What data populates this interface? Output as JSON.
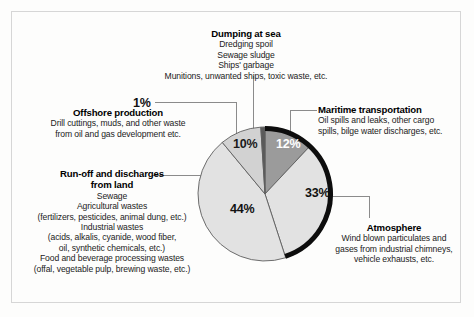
{
  "figure": {
    "background_color": "#fdfdfc",
    "frame_color": "#d6d6d6"
  },
  "chart_data": {
    "type": "pie",
    "title": "",
    "subtitle": "",
    "xlabel": "",
    "ylabel": "",
    "legend_position": "callouts-around-pie",
    "grid": false,
    "total": 100,
    "unit": "%",
    "start_angle_deg": 0,
    "direction": "clockwise",
    "categories": [
      "Maritime transportation",
      "Atmosphere",
      "Run-off and discharges from land",
      "Dumping at sea",
      "Offshore production"
    ],
    "values": [
      12,
      33,
      44,
      10,
      1
    ],
    "labels": [
      "12%",
      "33%",
      "44%",
      "10%",
      "1%"
    ],
    "colors": [
      "#9b9b9b",
      "#e2e2e2",
      "#e2e2e2",
      "#d2d2d2",
      "#5a5a5a"
    ],
    "slices": [
      {
        "name": "Maritime transportation",
        "value": 12,
        "label": "12%",
        "color": "#9b9b9b",
        "label_color": "#ffffff",
        "start_deg": 0,
        "end_deg": 43.2
      },
      {
        "name": "Atmosphere",
        "value": 33,
        "label": "33%",
        "color": "#e2e2e2",
        "label_color": "#111111",
        "start_deg": 43.2,
        "end_deg": 162.0
      },
      {
        "name": "Run-off and discharges from land",
        "value": 44,
        "label": "44%",
        "color": "#e2e2e2",
        "label_color": "#111111",
        "start_deg": 162.0,
        "end_deg": 320.4
      },
      {
        "name": "Dumping at sea",
        "value": 10,
        "label": "10%",
        "color": "#d2d2d2",
        "label_color": "#1a1a1a",
        "start_deg": 320.4,
        "end_deg": 356.4
      },
      {
        "name": "Offshore production",
        "value": 1,
        "label": "1%",
        "color": "#5a5a5a",
        "label_color": "#111111",
        "start_deg": 356.4,
        "end_deg": 360.0
      }
    ],
    "annotations": [
      {
        "slice": "Dumping at sea",
        "heading": "Dumping at sea",
        "lines": [
          "Dredging spoil",
          "Sewage sludge",
          "Ships' garbage",
          "Munitions, unwanted ships, toxic waste, etc."
        ]
      },
      {
        "slice": "Offshore production",
        "heading": "Offshore production",
        "percent": "1%",
        "lines": [
          "Drill cuttings, muds, and other waste",
          "from oil and gas development etc."
        ]
      },
      {
        "slice": "Maritime transportation",
        "heading": "Maritime transportation",
        "lines": [
          "Oil spills and leaks, other cargo",
          "spills, bilge water discharges, etc."
        ]
      },
      {
        "slice": "Run-off and discharges from land",
        "heading_line1": "Run-off and discharges",
        "heading_line2": "from land",
        "lines": [
          "Sewage",
          "Agricultural wastes",
          "(fertilizers, pesticides, animal dung, etc.)",
          "Industrial wastes",
          "(acids, alkalis, cyanide, wood fiber,",
          "oil, synthetic chemicals, etc.)",
          "Food and beverage processing wastes",
          "(offal, vegetable pulp, brewing waste, etc.)"
        ]
      },
      {
        "slice": "Atmosphere",
        "heading": "Atmosphere",
        "lines": [
          "Wind blown particulates and",
          "gases from industrial chimneys,",
          "vehicle exhausts, etc."
        ]
      }
    ]
  },
  "callouts": {
    "dumping": {
      "heading": "Dumping at sea",
      "line1": "Dredging spoil",
      "line2": "Sewage sludge",
      "line3": "Ships' garbage",
      "line4": "Munitions, unwanted ships, toxic waste, etc."
    },
    "offshore": {
      "percent": "1%",
      "heading": "Offshore production",
      "line1": "Drill cuttings, muds, and other waste",
      "line2": "from oil and gas development etc."
    },
    "maritime": {
      "heading": "Maritime transportation",
      "line1": "Oil spills and leaks, other cargo",
      "line2": "spills, bilge water discharges, etc."
    },
    "runoff": {
      "heading1": "Run-off and discharges",
      "heading2": "from land",
      "line1": "Sewage",
      "line2": "Agricultural wastes",
      "line3": "(fertilizers, pesticides, animal dung, etc.)",
      "line4": "Industrial wastes",
      "line5": "(acids, alkalis, cyanide, wood fiber,",
      "line6": "oil, synthetic chemicals, etc.)",
      "line7": "Food and beverage processing wastes",
      "line8": "(offal, vegetable pulp, brewing waste, etc.)"
    },
    "atmosphere": {
      "heading": "Atmosphere",
      "line1": "Wind blown particulates and",
      "line2": "gases from industrial chimneys,",
      "line3": "vehicle exhausts, etc."
    }
  },
  "pie_labels": {
    "p12": "12%",
    "p10": "10%",
    "p33": "33%",
    "p44": "44%",
    "p1": "1%"
  }
}
